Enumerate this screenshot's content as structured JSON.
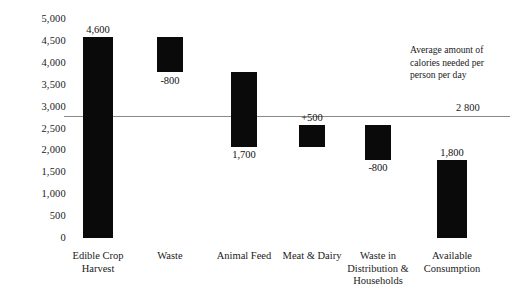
{
  "chart_data": {
    "type": "bar",
    "chart_subtype": "waterfall",
    "title": "",
    "xlabel": "",
    "ylabel": "",
    "ylim": [
      0,
      5000
    ],
    "grid": false,
    "legend": "none",
    "categories": [
      "Edible Crop Harvest",
      "Waste",
      "Animal Feed",
      "Meat & Dairy",
      "Waste in Distribution & Households",
      "Available Consumption"
    ],
    "category_lines": [
      [
        "Edible Crop",
        "Harvest"
      ],
      [
        "Waste"
      ],
      [
        "Animal Feed"
      ],
      [
        "Meat & Dairy"
      ],
      [
        "Waste in",
        "Distribution &",
        "Households"
      ],
      [
        "Available",
        "Consumption"
      ]
    ],
    "data_labels": [
      "4,600",
      "-800",
      "1,700",
      "+500",
      "-800",
      "1,800"
    ],
    "bars": [
      {
        "category": "Edible Crop Harvest",
        "bottom": 0,
        "top": 4600,
        "delta": 4600,
        "label": "4,600",
        "label_position": "above"
      },
      {
        "category": "Waste",
        "bottom": 3800,
        "top": 4600,
        "delta": -800,
        "label": "-800",
        "label_position": "below"
      },
      {
        "category": "Animal Feed",
        "bottom": 2100,
        "top": 3800,
        "delta": -1700,
        "label": "1,700",
        "label_position": "below"
      },
      {
        "category": "Meat & Dairy",
        "bottom": 2100,
        "top": 2600,
        "delta": 500,
        "label": "+500",
        "label_position": "above"
      },
      {
        "category": "Waste in Distribution & Households",
        "bottom": 1800,
        "top": 2600,
        "delta": -800,
        "label": "-800",
        "label_position": "below"
      },
      {
        "category": "Available Consumption",
        "bottom": 0,
        "top": 1800,
        "delta": 1800,
        "label": "1,800",
        "label_position": "above"
      }
    ],
    "yticks": [
      "5,000",
      "4,500",
      "4,000",
      "3,500",
      "3,000",
      "2,500",
      "2,000",
      "1,500",
      "1,000",
      "500",
      "0"
    ],
    "ytick_values": [
      5000,
      4500,
      4000,
      3500,
      3000,
      2500,
      2000,
      1500,
      1000,
      500,
      0
    ],
    "reference_line": {
      "value": 2800,
      "value_label": "2 800",
      "annotation": "Average amount of calories needed per person per day",
      "annotation_lines": [
        "Average amount of",
        "calories needed per",
        "person per day"
      ],
      "color": "#8a8a8a"
    },
    "colors": {
      "bar": "#0a0a0a",
      "reference_line": "#8a8a8a",
      "text": "#1a1a1a",
      "background": "#ffffff"
    }
  }
}
